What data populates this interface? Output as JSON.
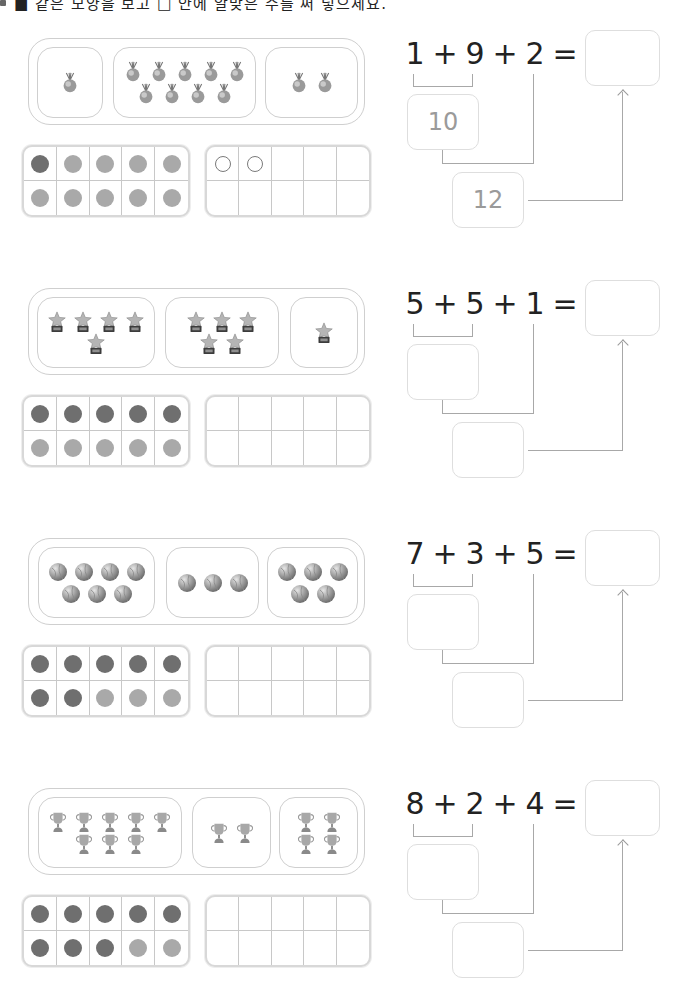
{
  "header": {
    "instruction_partial": "■ 같은 모양을 보고 □ 안에 알맞은 수를 써 넣으세요."
  },
  "colors": {
    "dot_dark": "#6f6f6f",
    "dot_light": "#a9a9a9",
    "border": "#cfcfcf",
    "text": "#222222",
    "hint_text": "#9a9a9a"
  },
  "problems": [
    {
      "icon": "medal-icon",
      "groups": [
        1,
        9,
        2
      ],
      "equation": {
        "a": "1",
        "op1": "+",
        "b": "9",
        "op2": "+",
        "c": "2",
        "eq": "="
      },
      "first_sum": "10",
      "second_sum": "12",
      "final_answer": "",
      "ten_frame_left": [
        "dark",
        "light",
        "light",
        "light",
        "light",
        "light",
        "light",
        "light",
        "light",
        "light"
      ],
      "ten_frame_right": [
        "hollow",
        "hollow",
        "",
        "",
        "",
        "",
        "",
        "",
        "",
        ""
      ]
    },
    {
      "icon": "star-trophy-icon",
      "groups": [
        5,
        5,
        1
      ],
      "equation": {
        "a": "5",
        "op1": "+",
        "b": "5",
        "op2": "+",
        "c": "1",
        "eq": "="
      },
      "first_sum": "",
      "second_sum": "",
      "final_answer": "",
      "ten_frame_left": [
        "dark",
        "dark",
        "dark",
        "dark",
        "dark",
        "light",
        "light",
        "light",
        "light",
        "light"
      ],
      "ten_frame_right": [
        "",
        "",
        "",
        "",
        "",
        "",
        "",
        "",
        "",
        ""
      ]
    },
    {
      "icon": "ball-icon",
      "groups": [
        7,
        3,
        5
      ],
      "equation": {
        "a": "7",
        "op1": "+",
        "b": "3",
        "op2": "+",
        "c": "5",
        "eq": "="
      },
      "first_sum": "",
      "second_sum": "",
      "final_answer": "",
      "ten_frame_left": [
        "dark",
        "dark",
        "dark",
        "dark",
        "dark",
        "dark",
        "dark",
        "light",
        "light",
        "light"
      ],
      "ten_frame_right": [
        "",
        "",
        "",
        "",
        "",
        "",
        "",
        "",
        "",
        ""
      ]
    },
    {
      "icon": "cup-trophy-icon",
      "groups": [
        8,
        2,
        4
      ],
      "equation": {
        "a": "8",
        "op1": "+",
        "b": "2",
        "op2": "+",
        "c": "4",
        "eq": "="
      },
      "first_sum": "",
      "second_sum": "",
      "final_answer": "",
      "ten_frame_left": [
        "dark",
        "dark",
        "dark",
        "dark",
        "dark",
        "dark",
        "dark",
        "dark",
        "light",
        "light"
      ],
      "ten_frame_right": [
        "",
        "",
        "",
        "",
        "",
        "",
        "",
        "",
        "",
        ""
      ]
    }
  ]
}
